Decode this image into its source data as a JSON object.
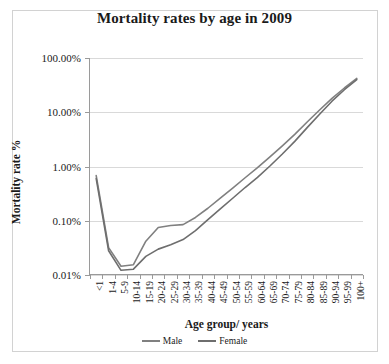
{
  "chart_data": {
    "type": "line",
    "title": "Mortality rates by age in 2009",
    "xlabel": "Age group/ years",
    "ylabel": "Mortality rate %",
    "yscale": "log",
    "ylim": [
      0.01,
      100
    ],
    "ytick_labels": [
      "0.01%",
      "0.10%",
      "1.00%",
      "10.00%",
      "100.00%"
    ],
    "ytick_values": [
      0.01,
      0.1,
      1,
      10,
      100
    ],
    "grid": true,
    "legend_position": "bottom",
    "categories": [
      "<1",
      "1-4",
      "5-9",
      "10-14",
      "15-19",
      "20-24",
      "25-29",
      "30-34",
      "35-39",
      "40-44",
      "45-49",
      "50-54",
      "55-59",
      "60-64",
      "65-69",
      "70-74",
      "75-79",
      "80-84",
      "85-89",
      "90-94",
      "95-99",
      "100+"
    ],
    "series": [
      {
        "name": "Male",
        "color": "#808080",
        "values": [
          0.68,
          0.032,
          0.0145,
          0.0155,
          0.042,
          0.075,
          0.082,
          0.085,
          0.115,
          0.17,
          0.26,
          0.4,
          0.62,
          0.95,
          1.5,
          2.4,
          3.9,
          6.6,
          11.0,
          18.0,
          28.0,
          42.0
        ]
      },
      {
        "name": "Female",
        "color": "#6e6e6e",
        "values": [
          0.6,
          0.028,
          0.0122,
          0.0128,
          0.022,
          0.03,
          0.036,
          0.045,
          0.066,
          0.105,
          0.165,
          0.26,
          0.41,
          0.63,
          1.02,
          1.7,
          2.9,
          5.2,
          9.2,
          16.0,
          26.0,
          40.0
        ]
      }
    ]
  },
  "legend": {
    "items": [
      {
        "label": "Male"
      },
      {
        "label": "Female"
      }
    ]
  }
}
